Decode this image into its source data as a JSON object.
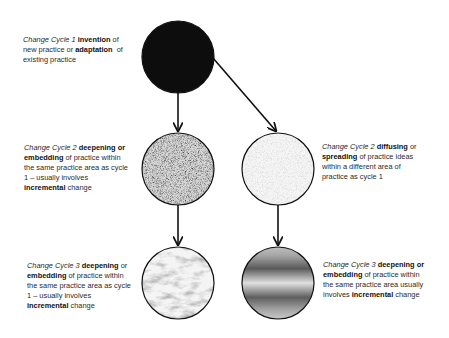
{
  "nodes": [
    {
      "id": "cycle1",
      "fill": "dark",
      "label": {
        "lines": [
          [
            {
              "t": "Change Cycle 1 ",
              "s": "i"
            },
            {
              "t": "invention",
              "s": "b"
            },
            {
              "t": " of",
              "s": ""
            }
          ],
          [
            {
              "t": "new practice or ",
              "s": ""
            },
            {
              "t": "adaptation",
              "s": "b"
            },
            {
              "t": "  of",
              "s": ""
            }
          ],
          [
            {
              "t": "existing practice",
              "s": ""
            }
          ]
        ]
      }
    },
    {
      "id": "cycle2-deepening",
      "fill": "speckled-gray",
      "label": {
        "lines": [
          [
            {
              "t": "Change Cycle 2 ",
              "s": "i"
            },
            {
              "t": "deepening or",
              "s": "b"
            }
          ],
          [
            {
              "t": "embedding",
              "s": "b"
            },
            {
              "t": " of practice within",
              "s": ""
            }
          ],
          [
            {
              "t": "the same practice area as cycle",
              "s": ""
            }
          ],
          [
            {
              "t": "1 – usually involves",
              "s": ""
            }
          ],
          [
            {
              "t": "incremental",
              "s": "b"
            },
            {
              "t": " change",
              "s": ""
            }
          ]
        ]
      }
    },
    {
      "id": "cycle2-diffusing",
      "fill": "light-speckle",
      "label": {
        "lines": [
          [
            {
              "t": "Change Cycle 2 ",
              "s": "i"
            },
            {
              "t": "diffusing",
              "s": "b"
            },
            {
              "t": " or",
              "s": ""
            }
          ],
          [
            {
              "t": "spreading",
              "s": "b"
            },
            {
              "t": " of practice ideas",
              "s": ""
            }
          ],
          [
            {
              "t": "within a different area of",
              "s": ""
            }
          ],
          [
            {
              "t": "practice as cycle 1",
              "s": ""
            }
          ]
        ]
      }
    },
    {
      "id": "cycle3-left",
      "fill": "marble",
      "label": {
        "lines": [
          [
            {
              "t": "Change Cycle 3 ",
              "s": "i"
            },
            {
              "t": "deepening",
              "s": "b"
            },
            {
              "t": " or",
              "s": ""
            }
          ],
          [
            {
              "t": "embedding",
              "s": "b"
            },
            {
              "t": " of practice within",
              "s": ""
            }
          ],
          [
            {
              "t": "the same practice area as cycle",
              "s": ""
            }
          ],
          [
            {
              "t": "1 – usually involves",
              "s": ""
            }
          ],
          [
            {
              "t": "incremental",
              "s": "b"
            },
            {
              "t": " change",
              "s": ""
            }
          ]
        ]
      }
    },
    {
      "id": "cycle3-right",
      "fill": "banded-gradient",
      "label": {
        "lines": [
          [
            {
              "t": "Change Cycle 3 ",
              "s": "i"
            },
            {
              "t": "deepening or",
              "s": "b"
            }
          ],
          [
            {
              "t": "embedding",
              "s": "b"
            },
            {
              "t": " of practice within",
              "s": ""
            }
          ],
          [
            {
              "t": "the same practice area usually",
              "s": ""
            }
          ],
          [
            {
              "t": "involves ",
              "s": ""
            },
            {
              "t": "incremental",
              "s": "b"
            },
            {
              "t": " change",
              "s": ""
            }
          ]
        ]
      }
    }
  ],
  "edges": [
    {
      "from": "cycle1",
      "to": "cycle2-deepening"
    },
    {
      "from": "cycle1",
      "to": "cycle2-diffusing"
    },
    {
      "from": "cycle2-deepening",
      "to": "cycle3-left"
    },
    {
      "from": "cycle2-diffusing",
      "to": "cycle3-right"
    }
  ],
  "colors": {
    "stroke": "#111111",
    "dark_fill": "#0d0d0d",
    "text": "#2a2a2a"
  }
}
